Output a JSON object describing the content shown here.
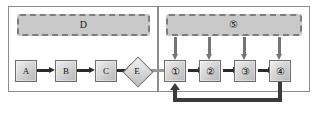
{
  "diagram": {
    "type": "process-flow",
    "panels": [
      {
        "id": "left",
        "name": "left-panel"
      },
      {
        "id": "right",
        "name": "right-panel"
      }
    ],
    "groups": [
      {
        "id": "d",
        "label": "D",
        "style": "dashed",
        "panel": "left",
        "icon": "dashed-group-container"
      },
      {
        "id": "five",
        "label": "⑤",
        "style": "dashed",
        "panel": "right",
        "icon": "dashed-group-container"
      }
    ],
    "nodes": [
      {
        "id": "a",
        "label": "A",
        "shape": "rect",
        "panel": "left"
      },
      {
        "id": "b",
        "label": "B",
        "shape": "rect",
        "panel": "left"
      },
      {
        "id": "c",
        "label": "C",
        "shape": "rect",
        "panel": "left"
      },
      {
        "id": "e",
        "label": "E",
        "shape": "diamond",
        "panel": "left"
      },
      {
        "id": "n1",
        "label": "①",
        "shape": "rect",
        "panel": "right"
      },
      {
        "id": "n2",
        "label": "②",
        "shape": "rect",
        "panel": "right"
      },
      {
        "id": "n3",
        "label": "③",
        "shape": "rect",
        "panel": "right"
      },
      {
        "id": "n4",
        "label": "④",
        "shape": "rect",
        "panel": "right"
      }
    ],
    "edges": [
      {
        "from": "a",
        "to": "b",
        "direction": "right"
      },
      {
        "from": "b",
        "to": "c",
        "direction": "right"
      },
      {
        "from": "c",
        "to": "e",
        "direction": "right"
      },
      {
        "from": "e",
        "to": "n1",
        "direction": "right"
      },
      {
        "from": "n1",
        "to": "n2",
        "direction": "right"
      },
      {
        "from": "n2",
        "to": "n3",
        "direction": "right"
      },
      {
        "from": "n3",
        "to": "n4",
        "direction": "right"
      },
      {
        "from": "five",
        "to": "n1",
        "direction": "down"
      },
      {
        "from": "five",
        "to": "n2",
        "direction": "down"
      },
      {
        "from": "five",
        "to": "n3",
        "direction": "down"
      },
      {
        "from": "five",
        "to": "n4",
        "direction": "down"
      },
      {
        "from": "n4",
        "to": "n1",
        "direction": "feedback-loop"
      }
    ],
    "colors": {
      "panel_border": "#8c8c8c",
      "group_fill": "#c9c9c9",
      "group_border": "#7d7d7d",
      "node_border": "#6e6e6e",
      "arrow_dark": "#2b2b2b",
      "arrow_light": "#9a9a9a",
      "arrow_vertical": "#757575",
      "feedback": "#3a3a3a",
      "background": "#ffffff"
    }
  }
}
